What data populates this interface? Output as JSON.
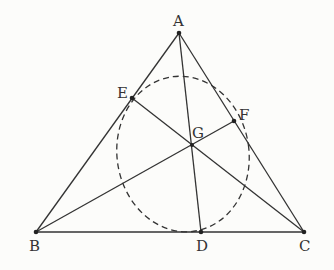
{
  "diagram": {
    "type": "geometry",
    "points": {
      "A": {
        "label": "A",
        "x": 179,
        "y": 33
      },
      "B": {
        "label": "B",
        "x": 36,
        "y": 232
      },
      "C": {
        "label": "C",
        "x": 304,
        "y": 232
      },
      "D": {
        "label": "D",
        "x": 201,
        "y": 232
      },
      "E": {
        "label": "E",
        "x": 132,
        "y": 98
      },
      "F": {
        "label": "F",
        "x": 234,
        "y": 121
      },
      "G": {
        "label": "G",
        "x": 192,
        "y": 145
      }
    },
    "segments": [
      "AB",
      "BC",
      "CA",
      "AD",
      "BF",
      "CE"
    ],
    "ellipse": {
      "style": "dashed",
      "cx": 183,
      "cy": 154,
      "rx": 66,
      "ry": 78,
      "rotate": -8
    },
    "colors": {
      "line": "#333333",
      "background": "#fcfcfa"
    }
  }
}
